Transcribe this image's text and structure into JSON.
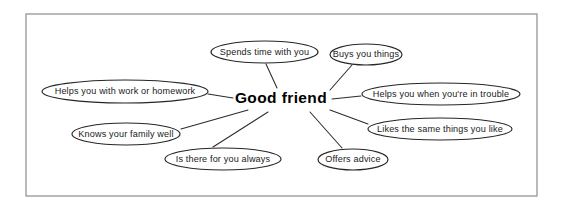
{
  "diagram": {
    "type": "mind-map",
    "title_shown": false,
    "frame": {
      "x": 26,
      "y": 14,
      "width": 511,
      "height": 182,
      "stroke_color": "#8d8d8d"
    },
    "background_color": "#ffffff",
    "center": {
      "label": "Good friend",
      "x": 281,
      "y": 99,
      "text_color": "#000000",
      "bold": true
    },
    "nodes": [
      {
        "id": "spends-time",
        "label": "Spends time with you",
        "cx": 264.5,
        "cy": 52,
        "rx": 53.5,
        "ry": 11,
        "anchor_x": 264.5,
        "anchor_y": 63
      },
      {
        "id": "buys-things",
        "label": "Buys you things",
        "cx": 366,
        "cy": 54.5,
        "rx": 36,
        "ry": 10.5,
        "anchor_x": 353,
        "anchor_y": 64.5
      },
      {
        "id": "helps-homework",
        "label": "Helps you with work or homework",
        "cx": 125,
        "cy": 91.5,
        "rx": 83,
        "ry": 11.5,
        "anchor_x": 207,
        "anchor_y": 94
      },
      {
        "id": "helps-trouble",
        "label": "Helps you when you're in trouble",
        "cx": 441,
        "cy": 94,
        "rx": 79,
        "ry": 11,
        "anchor_x": 362,
        "anchor_y": 96
      },
      {
        "id": "knows-family",
        "label": "Knows your family well",
        "cx": 126,
        "cy": 134,
        "rx": 54,
        "ry": 11,
        "anchor_x": 179,
        "anchor_y": 130
      },
      {
        "id": "likes-same-things",
        "label": "Likes the same things you like",
        "cx": 440,
        "cy": 129,
        "rx": 72,
        "ry": 11,
        "anchor_x": 369,
        "anchor_y": 125
      },
      {
        "id": "there-always",
        "label": "Is there for you always",
        "cx": 223,
        "cy": 159,
        "rx": 58,
        "ry": 11,
        "anchor_x": 212,
        "anchor_y": 148
      },
      {
        "id": "offers-advice",
        "label": "Offers advice",
        "cx": 353,
        "cy": 159.5,
        "rx": 35,
        "ry": 10.5,
        "anchor_x": 341,
        "anchor_y": 149
      }
    ],
    "connectors": [
      {
        "id": "to-spends-time",
        "x1": 277,
        "y1": 88,
        "x2": 266,
        "y2": 64
      },
      {
        "id": "to-buys-things",
        "x1": 330,
        "y1": 90,
        "x2": 352,
        "y2": 65
      },
      {
        "id": "to-helps-homework",
        "x1": 233,
        "y1": 98,
        "x2": 208,
        "y2": 94
      },
      {
        "id": "to-helps-trouble",
        "x1": 332,
        "y1": 99,
        "x2": 361,
        "y2": 96
      },
      {
        "id": "to-knows-family",
        "x1": 248,
        "y1": 110,
        "x2": 181,
        "y2": 129
      },
      {
        "id": "to-likes-same-things",
        "x1": 330,
        "y1": 110,
        "x2": 368,
        "y2": 124
      },
      {
        "id": "to-there-always",
        "x1": 268,
        "y1": 112,
        "x2": 213,
        "y2": 147
      },
      {
        "id": "to-offers-advice",
        "x1": 310,
        "y1": 112,
        "x2": 342,
        "y2": 148
      }
    ]
  }
}
